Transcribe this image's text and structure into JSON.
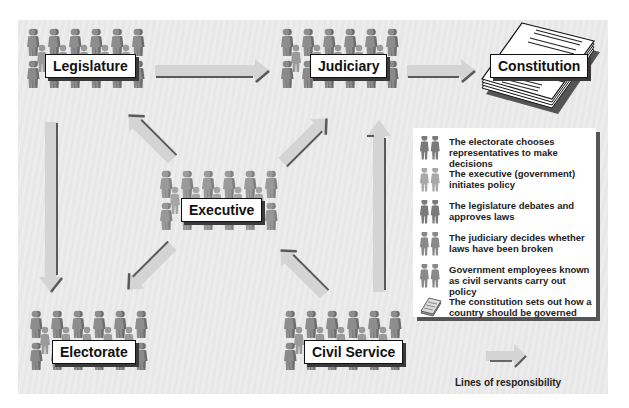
{
  "nodes": {
    "legislature": {
      "label": "Legislature"
    },
    "judiciary": {
      "label": "Judiciary"
    },
    "constitution": {
      "label": "Constitution"
    },
    "executive": {
      "label": "Executive"
    },
    "electorate": {
      "label": "Electorate"
    },
    "civil_service": {
      "label": "Civil Service"
    }
  },
  "edges": [
    {
      "from": "Legislature",
      "to": "Judiciary"
    },
    {
      "from": "Judiciary",
      "to": "Constitution"
    },
    {
      "from": "Legislature",
      "to": "Electorate"
    },
    {
      "from": "Executive",
      "to": "Legislature"
    },
    {
      "from": "Executive",
      "to": "Judiciary"
    },
    {
      "from": "Executive",
      "to": "Electorate"
    },
    {
      "from": "Civil Service",
      "to": "Executive"
    },
    {
      "from": "Civil Service",
      "to": "Judiciary"
    }
  ],
  "legend": {
    "items": [
      {
        "icon": "people-pair-icon",
        "text": "The electorate chooses representatives to make decisions"
      },
      {
        "icon": "people-pair-light-icon",
        "text": "The executive (government) initiates policy"
      },
      {
        "icon": "people-pair-icon",
        "text": "The legislature debates and approves laws"
      },
      {
        "icon": "people-pair-icon",
        "text": "The judiciary decides whether laws have been broken"
      },
      {
        "icon": "people-pair-icon",
        "text": "Government employees known as civil servants carry out policy"
      },
      {
        "icon": "document-stack-icon",
        "text": "The constitution sets out how a country should be governed"
      }
    ],
    "arrow_caption": "Lines of responsibility"
  },
  "colors": {
    "background": "#ebebeb",
    "people": "#8a8a8a",
    "arrow_fill": "#d6d6d6",
    "arrow_shadow": "#5a5a5a",
    "label_border": "#111111"
  }
}
